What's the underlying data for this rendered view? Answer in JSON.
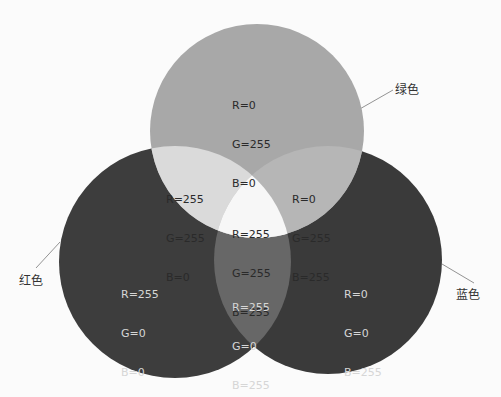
{
  "diagram": {
    "type": "venn-rgb-additive",
    "circles": [
      {
        "id": "green",
        "label": "绿色",
        "cx": 257,
        "cy": 131,
        "r": 107,
        "fill": "#a8a8a8",
        "rgb": {
          "R": "R=0",
          "G": "G=255",
          "B": "B=0"
        }
      },
      {
        "id": "red",
        "label": "红色",
        "cx": 175,
        "cy": 262,
        "r": 116,
        "fill": "#3d3d3d",
        "rgb": {
          "R": "R=255",
          "G": "G=0",
          "B": "B=0"
        }
      },
      {
        "id": "blue",
        "label": "蓝色",
        "cx": 328,
        "cy": 260,
        "r": 114,
        "fill": "#3a3a3a",
        "rgb": {
          "R": "R=0",
          "G": "G=0",
          "B": "B=255"
        }
      }
    ],
    "overlaps": {
      "red_green": {
        "fill": "#dadada",
        "rgb": {
          "R": "R=255",
          "G": "G=255",
          "B": "B=0"
        }
      },
      "green_blue": {
        "fill": "#b6b6b6",
        "rgb": {
          "R": "R=0",
          "G": "G=255",
          "B": "B=255"
        }
      },
      "red_blue": {
        "fill": "#676767",
        "rgb": {
          "R": "R=255",
          "G": "G=0",
          "B": "B=255"
        }
      },
      "all": {
        "fill": "#f7f7f7",
        "rgb": {
          "R": "R=255",
          "G": "G=255",
          "B": "B=255"
        }
      }
    }
  }
}
